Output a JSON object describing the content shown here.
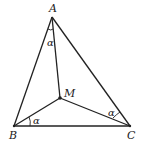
{
  "diagram": {
    "type": "triangle-with-interior-point",
    "points": {
      "A": {
        "label": "A",
        "x": 52,
        "y": 17
      },
      "B": {
        "label": "B",
        "x": 14,
        "y": 126
      },
      "C": {
        "label": "C",
        "x": 130,
        "y": 126
      },
      "M": {
        "label": "M",
        "x": 60,
        "y": 98
      }
    },
    "segments": [
      "AB",
      "BC",
      "CA",
      "MA",
      "MB",
      "MC"
    ],
    "angles": [
      {
        "at": "A",
        "between": [
          "AB",
          "AM"
        ],
        "label": "α"
      },
      {
        "at": "B",
        "between": [
          "BC",
          "BM"
        ],
        "label": "α"
      },
      {
        "at": "C",
        "between": [
          "CA",
          "CM"
        ],
        "label": "α"
      }
    ],
    "colors": {
      "stroke": "#222222",
      "background": "#ffffff"
    }
  }
}
